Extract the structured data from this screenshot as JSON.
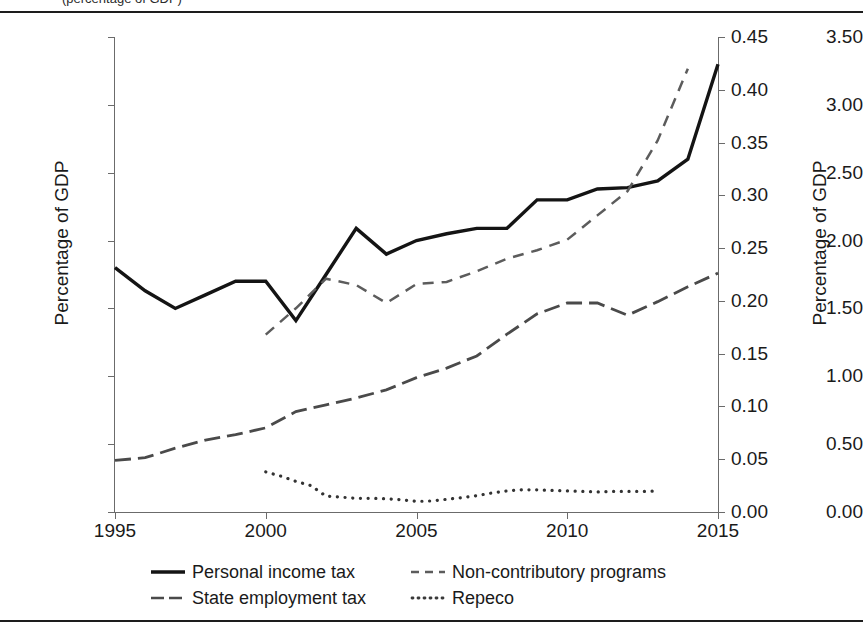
{
  "figure": {
    "caption_clipped": "(percentage of GDP)"
  },
  "axes": {
    "left": {
      "title": "Percentage of GDP",
      "ticks": [
        "0.00",
        "0.50",
        "1.00",
        "1.50",
        "2.00",
        "2.50",
        "3.00",
        "3.50"
      ],
      "min": 0.0,
      "max": 3.5
    },
    "right": {
      "title": "Percentage of GDP",
      "ticks": [
        "0.00",
        "0.05",
        "0.10",
        "0.15",
        "0.20",
        "0.25",
        "0.30",
        "0.35",
        "0.40",
        "0.45"
      ],
      "min": 0.0,
      "max": 0.45
    },
    "bottom": {
      "ticks": [
        "1995",
        "2000",
        "2005",
        "2010",
        "2015"
      ],
      "min": 1995,
      "max": 2015
    }
  },
  "legend": {
    "items": [
      {
        "label": "Personal income tax",
        "style": "solid",
        "axis": "left"
      },
      {
        "label": "Non-contributory programs",
        "style": "dashed-short",
        "axis": "right"
      },
      {
        "label": "State employment tax",
        "style": "dashed-long",
        "axis": "left"
      },
      {
        "label": "Repeco",
        "style": "dotted",
        "axis": "right"
      }
    ]
  },
  "chart_data": {
    "type": "line",
    "title": "",
    "subtitle": "",
    "xlabel": "",
    "ylabel": "Percentage of GDP",
    "y2label": "Percentage of GDP",
    "xlim": [
      1995,
      2015
    ],
    "ylim": [
      0.0,
      3.5
    ],
    "y2lim": [
      0.0,
      0.45
    ],
    "grid": false,
    "legend_position": "bottom",
    "x": [
      1995,
      1996,
      1997,
      1998,
      1999,
      2000,
      2001,
      2002,
      2003,
      2004,
      2005,
      2006,
      2007,
      2008,
      2009,
      2010,
      2011,
      2012,
      2013,
      2014,
      2015
    ],
    "series": [
      {
        "name": "Personal income tax",
        "axis": "left",
        "style": "solid",
        "x": [
          1995,
          1996,
          1997,
          1998,
          1999,
          2000,
          2001,
          2002,
          2003,
          2004,
          2005,
          2006,
          2007,
          2008,
          2009,
          2010,
          2011,
          2012,
          2013,
          2014,
          2015
        ],
        "values": [
          1.8,
          1.63,
          1.5,
          1.6,
          1.7,
          1.7,
          1.41,
          1.75,
          2.09,
          1.9,
          2.0,
          2.05,
          2.09,
          2.09,
          2.3,
          2.3,
          2.38,
          2.39,
          2.44,
          2.6,
          3.3
        ]
      },
      {
        "name": "Non-contributory programs",
        "axis": "right",
        "style": "dashed-short",
        "x": [
          2000,
          2001,
          2002,
          2003,
          2004,
          2005,
          2006,
          2007,
          2008,
          2009,
          2010,
          2011,
          2012,
          2013,
          2014
        ],
        "values": [
          0.168,
          0.193,
          0.221,
          0.215,
          0.198,
          0.216,
          0.218,
          0.228,
          0.24,
          0.248,
          0.258,
          0.281,
          0.304,
          0.352,
          0.42
        ]
      },
      {
        "name": "State employment tax",
        "axis": "left",
        "style": "dashed-long",
        "x": [
          1995,
          1996,
          1997,
          1998,
          1999,
          2000,
          2001,
          2002,
          2003,
          2004,
          2005,
          2006,
          2007,
          2008,
          2009,
          2010,
          2011,
          2012,
          2013,
          2014,
          2015
        ],
        "values": [
          0.38,
          0.4,
          0.47,
          0.53,
          0.57,
          0.62,
          0.74,
          0.79,
          0.84,
          0.9,
          0.99,
          1.06,
          1.15,
          1.31,
          1.46,
          1.54,
          1.54,
          1.45,
          1.55,
          1.66,
          1.76
        ]
      },
      {
        "name": "Repeco",
        "axis": "right",
        "style": "dotted",
        "x": [
          2000,
          2000.5,
          2001,
          2001.5,
          2002,
          2002.5,
          2003,
          2003.5,
          2004,
          2004.5,
          2005,
          2005.5,
          2006,
          2006.5,
          2007,
          2007.5,
          2008,
          2008.5,
          2009,
          2009.5,
          2010,
          2010.5,
          2011,
          2011.5,
          2012,
          2012.5,
          2013
        ],
        "values": [
          0.038,
          0.034,
          0.029,
          0.025,
          0.015,
          0.014,
          0.013,
          0.013,
          0.0125,
          0.0115,
          0.01,
          0.0105,
          0.012,
          0.0135,
          0.0155,
          0.018,
          0.02,
          0.021,
          0.021,
          0.0205,
          0.02,
          0.0195,
          0.019,
          0.0195,
          0.0195,
          0.0195,
          0.02
        ]
      }
    ]
  }
}
